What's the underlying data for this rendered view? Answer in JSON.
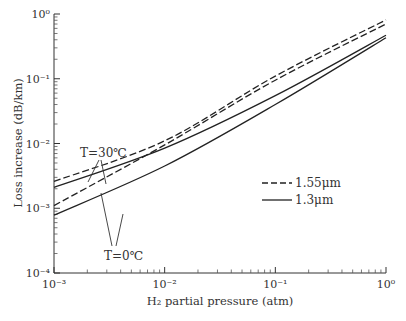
{
  "chart_data": {
    "type": "line",
    "title": "",
    "xlabel": "H₂ partial pressure (atm)",
    "ylabel": "Loss increase (dB/km)",
    "xscale": "log",
    "yscale": "log",
    "xlim": [
      0.001,
      1
    ],
    "ylim": [
      0.0001,
      1
    ],
    "x_ticks": [
      "10⁻³",
      "10⁻²",
      "10⁻¹",
      "10⁰"
    ],
    "y_ticks": [
      "10⁻⁴",
      "10⁻³",
      "10⁻²",
      "10⁻¹",
      "10⁰"
    ],
    "grid": false,
    "legend": [
      {
        "label": "1.55μm",
        "style": "dashed"
      },
      {
        "label": "1.3μm",
        "style": "solid"
      }
    ],
    "legend_position": "center-right",
    "annotations": [
      {
        "text": "T=30℃",
        "points_to": [
          "1.55μm T=30℃",
          "1.3μm T=30℃"
        ]
      },
      {
        "text": "T=0℃",
        "points_to": [
          "1.55μm T=0℃",
          "1.3μm T=0℃"
        ]
      }
    ],
    "series": [
      {
        "name": "1.55μm T=30℃",
        "style": "dashed",
        "x": [
          0.001,
          0.01,
          0.1,
          1
        ],
        "values": [
          0.0026,
          0.011,
          0.11,
          0.81
        ]
      },
      {
        "name": "1.55μm T=0℃",
        "style": "dashed",
        "x": [
          0.001,
          0.01,
          0.1,
          1
        ],
        "values": [
          0.0011,
          0.0095,
          0.095,
          0.7
        ]
      },
      {
        "name": "1.3μm T=30℃",
        "style": "solid",
        "x": [
          0.001,
          0.01,
          0.1,
          1
        ],
        "values": [
          0.0021,
          0.0085,
          0.055,
          0.47
        ]
      },
      {
        "name": "1.3μm T=0℃",
        "style": "solid",
        "x": [
          0.001,
          0.01,
          0.1,
          1
        ],
        "values": [
          0.00078,
          0.0045,
          0.04,
          0.43
        ]
      }
    ]
  },
  "labels": {
    "t30": "T=30℃",
    "t0": "T=0℃",
    "legend_dashed": "1.55μm",
    "legend_solid": "1.3μm",
    "xlabel": "H₂ partial pressure (atm)",
    "ylabel": "Loss increase (dB/km)"
  }
}
